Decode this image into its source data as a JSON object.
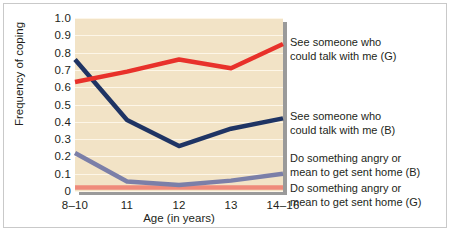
{
  "chart_data": {
    "type": "line",
    "title": "",
    "xlabel": "Age (in years)",
    "ylabel": "Frequency of coping",
    "categories": [
      "8–10",
      "11",
      "12",
      "13",
      "14–16"
    ],
    "ylim": [
      0,
      1.0
    ],
    "ytick_labels": [
      "1.0",
      "0.9",
      "0.8",
      "0.7",
      "0.6",
      "0.5",
      "0.4",
      "0.3",
      "0.2",
      "0.1",
      "0"
    ],
    "ytick_values": [
      1.0,
      0.9,
      0.8,
      0.7,
      0.6,
      0.5,
      0.4,
      0.3,
      0.2,
      0.1,
      0
    ],
    "grid": true,
    "legend_position": "right",
    "series": [
      {
        "name": "See someone who could talk with me (G)",
        "label_line1": "See someone who",
        "label_line2": "could talk with me (G)",
        "color": "#e8312a",
        "values": [
          0.63,
          0.69,
          0.76,
          0.71,
          0.85
        ]
      },
      {
        "name": "See someone who could talk with me (B)",
        "label_line1": "See someone who",
        "label_line2": "could talk with me (B)",
        "color": "#1f3464",
        "values": [
          0.76,
          0.41,
          0.26,
          0.36,
          0.42
        ]
      },
      {
        "name": "Do something angry or mean to get sent home (B)",
        "label_line1": "Do something angry or",
        "label_line2": "mean to get sent home (B)",
        "color": "#7b7fa8",
        "values": [
          0.22,
          0.055,
          0.035,
          0.06,
          0.1
        ]
      },
      {
        "name": "Do something angry or mean to get sent home (G)",
        "label_line1": "Do something angry or",
        "label_line2": "mean to get sent home (G)",
        "color": "#ef8a7a",
        "values": [
          0.02,
          0.02,
          0.02,
          0.02,
          0.02
        ]
      }
    ],
    "colors": {
      "plot_background": "#f2e3c6",
      "gridline": "#fdf6e8",
      "axis_shadow": "#9a9a9a",
      "frame_border": "#c9c9c9",
      "text": "#231f20"
    }
  }
}
